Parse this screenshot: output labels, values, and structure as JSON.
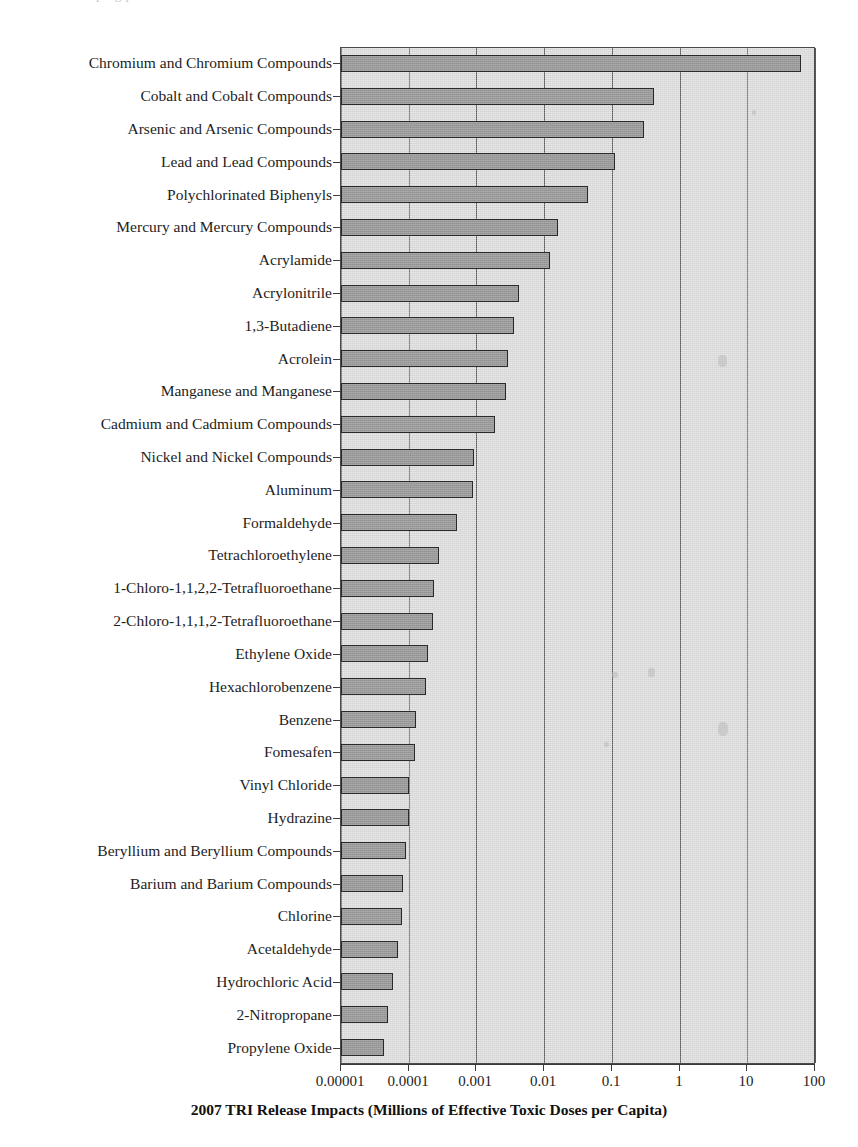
{
  "figure": {
    "top_cutoff_text": "ping                   p",
    "xlabel": "2007 TRI Release Impacts (Millions of Effective Toxic Doses per Capita)"
  },
  "axis": {
    "tick_labels": [
      "0.00001",
      "0.0001",
      "0.001",
      "0.01",
      "0.1",
      "1",
      "10",
      "100"
    ],
    "scale": "log10",
    "min": 1e-05,
    "max": 100
  },
  "colors": {
    "plot_background": "#d4d4d4",
    "bar_fill": "#9a9a9a",
    "bar_border": "#2a2a2a",
    "gridline": "#585858",
    "axis": "#3a3a3a",
    "text": "#1d1d1d"
  },
  "chart_data": {
    "type": "bar",
    "orientation": "horizontal",
    "title": "",
    "xlabel": "2007 TRI Release Impacts (Millions of Effective Toxic Doses per Capita)",
    "ylabel": "",
    "xscale": "log",
    "xlim": [
      1e-05,
      100
    ],
    "xticks": [
      1e-05,
      0.0001,
      0.001,
      0.01,
      0.1,
      1,
      10,
      100
    ],
    "xtick_labels": [
      "0.00001",
      "0.0001",
      "0.001",
      "0.01",
      "0.1",
      "1",
      "10",
      "100"
    ],
    "grid": true,
    "legend": "none",
    "categories": [
      "Chromium and Chromium Compounds",
      "Cobalt and Cobalt Compounds",
      "Arsenic and Arsenic Compounds",
      "Lead and Lead Compounds",
      "Polychlorinated Biphenyls",
      "Mercury and Mercury Compounds",
      "Acrylamide",
      "Acrylonitrile",
      "1,3-Butadiene",
      "Acrolein",
      "Manganese and Manganese",
      "Cadmium and Cadmium Compounds",
      "Nickel and Nickel Compounds",
      "Aluminum",
      "Formaldehyde",
      "Tetrachloroethylene",
      "1-Chloro-1,1,2,2-Tetrafluoroethane",
      "2-Chloro-1,1,1,2-Tetrafluoroethane",
      "Ethylene Oxide",
      "Hexachlorobenzene",
      "Benzene",
      "Fomesafen",
      "Vinyl Chloride",
      "Hydrazine",
      "Beryllium and Beryllium Compounds",
      "Barium and Barium Compounds",
      "Chlorine",
      "Acetaldehyde",
      "Hydrochloric Acid",
      "2-Nitropropane",
      "Propylene Oxide"
    ],
    "values": [
      62,
      0.42,
      0.3,
      0.11,
      0.045,
      0.016,
      0.012,
      0.0042,
      0.0036,
      0.0029,
      0.0027,
      0.0019,
      0.00092,
      0.0009,
      0.00052,
      0.00028,
      0.00024,
      0.00023,
      0.00019,
      0.00018,
      0.00013,
      0.000125,
      0.0001,
      0.0001,
      9.2e-05,
      8.2e-05,
      8e-05,
      7e-05,
      5.8e-05,
      5e-05,
      4.3e-05
    ]
  }
}
